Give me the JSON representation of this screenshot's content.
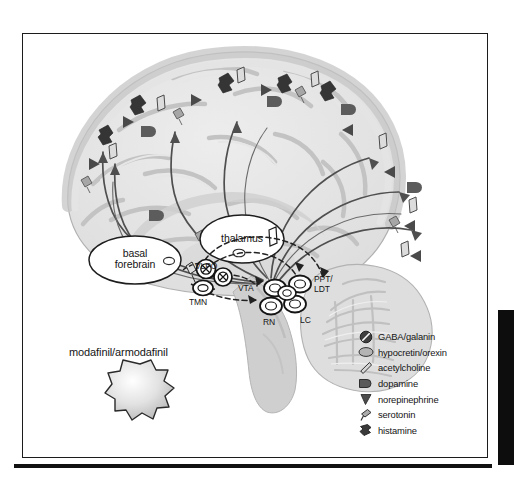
{
  "figure": {
    "background_color": "#ffffff",
    "frame_color": "#1c1c1c"
  },
  "regions": [
    {
      "id": "basal-forebrain",
      "label": "basal\nforebrain",
      "line1": "basal",
      "line2": "forebrain"
    },
    {
      "id": "thalamus",
      "label": "thalamus"
    }
  ],
  "nuclei": [
    {
      "id": "vlpo",
      "label": "VLPO"
    },
    {
      "id": "tmn",
      "label": "TMN"
    },
    {
      "id": "vta",
      "label": "VTA"
    },
    {
      "id": "rn",
      "label": "RN"
    },
    {
      "id": "lc",
      "label": "LC"
    },
    {
      "id": "ppt-ldt",
      "label": "PPT/\nLDT",
      "line1": "PPT/",
      "line2": "LDT"
    }
  ],
  "drug": {
    "label": "modafinil/armodafinil",
    "marker": "starburst"
  },
  "legend": {
    "items": [
      {
        "icon": "circle-slash-icon",
        "label": "GABA/galanin",
        "color": "#3f3f3f"
      },
      {
        "icon": "ellipse-icon",
        "label": "hypocretin/orexin",
        "color": "#9c9c9c"
      },
      {
        "icon": "diamond-icon",
        "label": "acetylcholine",
        "color": "#cfcfcf"
      },
      {
        "icon": "dopamine-capsule-icon",
        "label": "dopamine",
        "color": "#5a5a5a"
      },
      {
        "icon": "triangle-icon",
        "label": "norepinephrine",
        "color": "#4b4b4b"
      },
      {
        "icon": "serotonin-flag-icon",
        "label": "serotonin",
        "color": "#a8a8a8"
      },
      {
        "icon": "histamine-burst-icon",
        "label": "histamine",
        "color": "#3a3a3a"
      }
    ]
  },
  "colors": {
    "brain_light": "#e9e9e9",
    "brain_mid": "#d4d4d4",
    "brain_dark": "#bdbdbd",
    "cortex_band": "#c8c8c8",
    "outline": "#9a9a9a",
    "pathway_solid": "#4a4a4a",
    "pathway_dashed": "#2b2b2b",
    "text": "#151515"
  }
}
